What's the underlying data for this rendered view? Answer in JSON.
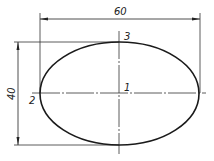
{
  "drawing": {
    "title": "Ellipse construction",
    "dimensions": {
      "width_label": "60",
      "height_label": "40"
    },
    "points": {
      "center": "1",
      "left": "2",
      "top": "3"
    },
    "colors": {
      "line": "#1a1a1a",
      "thin": "#333333",
      "background": "#ffffff"
    }
  }
}
